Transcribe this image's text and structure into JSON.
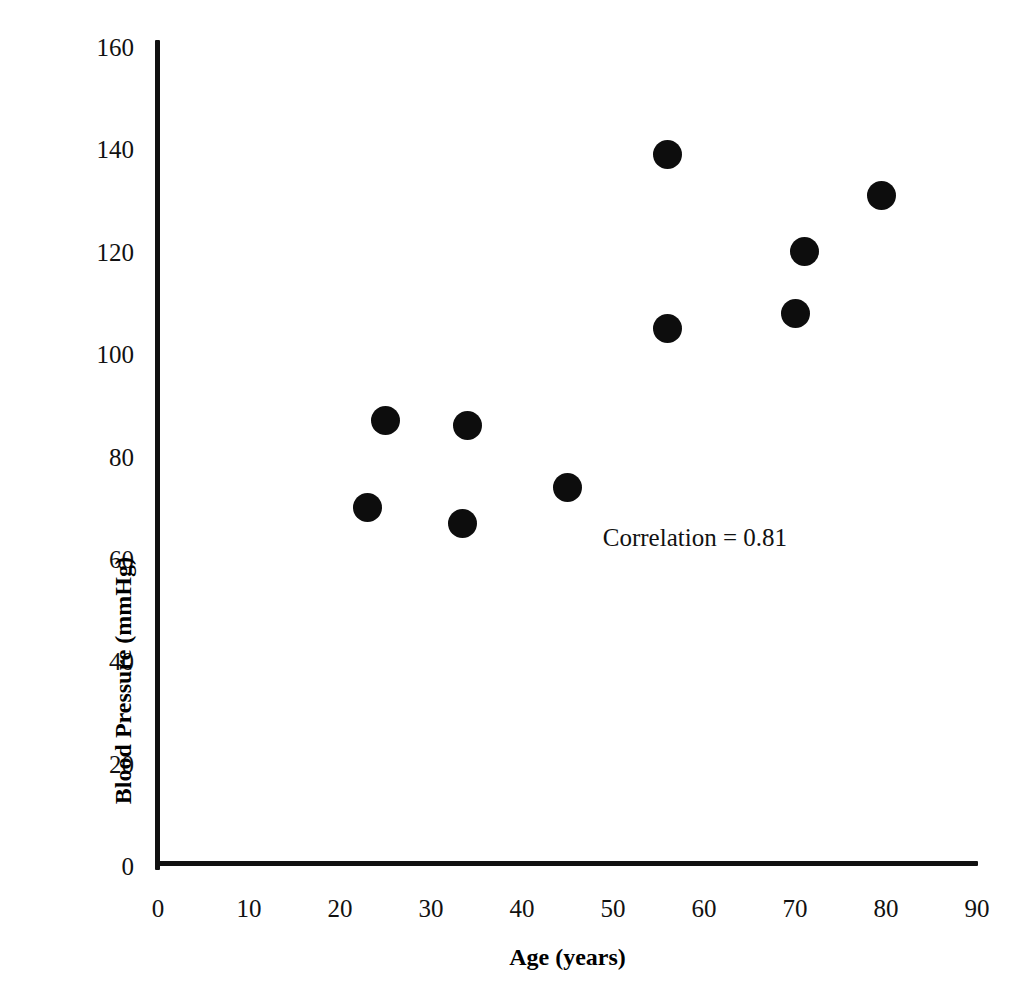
{
  "chart_data": {
    "type": "scatter",
    "title": "",
    "xlabel": "Age (years)",
    "ylabel": "Blood Pressure (mmHg)",
    "xlim": [
      0,
      90
    ],
    "ylim": [
      0,
      160
    ],
    "xticks": [
      0,
      10,
      20,
      30,
      40,
      50,
      60,
      70,
      80,
      90
    ],
    "yticks": [
      0,
      20,
      40,
      60,
      80,
      100,
      120,
      140,
      160
    ],
    "grid": false,
    "legend": null,
    "marker": {
      "shape": "circle",
      "color": "#0d0d0d",
      "size_px": 29
    },
    "points": [
      {
        "x": 23.0,
        "y": 70
      },
      {
        "x": 25.0,
        "y": 87
      },
      {
        "x": 33.5,
        "y": 67
      },
      {
        "x": 34.0,
        "y": 86
      },
      {
        "x": 45.0,
        "y": 74
      },
      {
        "x": 56.0,
        "y": 105
      },
      {
        "x": 56.0,
        "y": 139
      },
      {
        "x": 70.0,
        "y": 108
      },
      {
        "x": 71.0,
        "y": 120
      },
      {
        "x": 79.5,
        "y": 131
      }
    ],
    "annotations": [
      {
        "text": "Correlation = 0.81",
        "x": 59,
        "y": 64
      }
    ]
  },
  "axes": {
    "x_tick_labels": [
      "0",
      "10",
      "20",
      "30",
      "40",
      "50",
      "60",
      "70",
      "80",
      "90"
    ],
    "y_tick_labels": [
      "0",
      "20",
      "40",
      "60",
      "80",
      "100",
      "120",
      "140",
      "160"
    ],
    "x_title": "Age (years)",
    "y_title": "Blood Pressure (mmHg)"
  },
  "annotation_text": "Correlation = 0.81"
}
